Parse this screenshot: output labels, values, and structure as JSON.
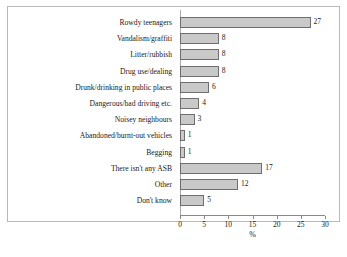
{
  "chart_data": {
    "type": "bar",
    "orientation": "horizontal",
    "title": "",
    "xlabel": "%",
    "ylabel": "",
    "xlim": [
      0,
      30
    ],
    "xticks": [
      0,
      5,
      10,
      15,
      20,
      25,
      30
    ],
    "grid": false,
    "legend": false,
    "bar_color": "#c9c9c9",
    "bar_border_color": "#6e6e6e",
    "categories": [
      "Rowdy teenagers",
      "Vandalism/graffiti",
      "Litter/rubbish",
      "Drug use/dealing",
      "Drunk/drinking in public places",
      "Dangerous/bad driving etc.",
      "Noisey neighbours",
      "Abandoned/burnt-out vehicles",
      "Begging",
      "There isn't any ASB",
      "Other",
      "Don't know"
    ],
    "values": [
      27,
      8,
      8,
      8,
      6,
      4,
      3,
      1,
      1,
      17,
      12,
      5
    ],
    "data_labels": [
      "27",
      "8",
      "8",
      "8",
      "6",
      "4",
      "3",
      "1",
      "1",
      "17",
      "12",
      "5"
    ]
  }
}
